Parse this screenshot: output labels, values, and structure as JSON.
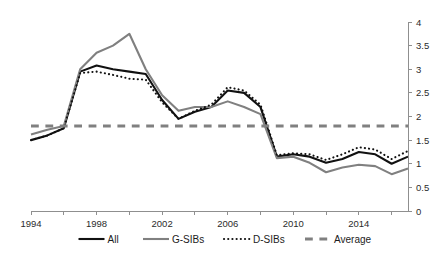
{
  "chart_data": {
    "type": "line",
    "title": "",
    "subtitle": "",
    "xlabel": "",
    "ylabel": "",
    "xlim": [
      1994,
      2017
    ],
    "ylim": [
      0,
      4
    ],
    "y_ticks": [
      "0",
      "0.5",
      "1",
      "1.5",
      "2",
      "2.5",
      "3",
      "3.5",
      "4"
    ],
    "y_tick_values": [
      0,
      0.5,
      1,
      1.5,
      2,
      2.5,
      3,
      3.5,
      4
    ],
    "x_ticks_labeled": [
      "1994",
      "1998",
      "2002",
      "2006",
      "2010",
      "2014"
    ],
    "x_tick_label_values": [
      1994,
      1998,
      2002,
      2006,
      2010,
      2014
    ],
    "x_tick_values": [
      1994,
      1996,
      1998,
      2000,
      2002,
      2004,
      2006,
      2008,
      2010,
      2012,
      2014,
      2016
    ],
    "grid": false,
    "y_axis_position": "right",
    "legend_position": "bottom",
    "x": [
      1994,
      1995,
      1996,
      1997,
      1998,
      1999,
      2000,
      2001,
      2002,
      2003,
      2004,
      2005,
      2006,
      2007,
      2008,
      2009,
      2010,
      2011,
      2012,
      2013,
      2014,
      2015,
      2016,
      2017
    ],
    "series": [
      {
        "name": "All",
        "color": "#111111",
        "style": "solid",
        "width": 2.1,
        "values": [
          1.5,
          1.6,
          1.75,
          2.95,
          3.08,
          3.0,
          2.95,
          2.9,
          2.35,
          1.95,
          2.1,
          2.2,
          2.55,
          2.5,
          2.2,
          1.15,
          1.2,
          1.15,
          1.02,
          1.1,
          1.25,
          1.2,
          1.0,
          1.15
        ]
      },
      {
        "name": "G-SIBs",
        "color": "#808080",
        "style": "solid",
        "width": 2.1,
        "values": [
          1.62,
          1.72,
          1.8,
          3.0,
          3.35,
          3.5,
          3.75,
          3.0,
          2.45,
          2.12,
          2.2,
          2.2,
          2.32,
          2.2,
          2.05,
          1.12,
          1.15,
          1.02,
          0.82,
          0.92,
          0.98,
          0.95,
          0.78,
          0.9
        ]
      },
      {
        "name": "D-SIBs",
        "color": "#111111",
        "style": "dotted",
        "width": 2.1,
        "values": [
          1.5,
          1.6,
          1.75,
          2.92,
          2.95,
          2.88,
          2.8,
          2.78,
          2.3,
          1.95,
          2.12,
          2.25,
          2.62,
          2.55,
          2.25,
          1.18,
          1.22,
          1.2,
          1.08,
          1.2,
          1.35,
          1.3,
          1.1,
          1.27
        ]
      },
      {
        "name": "Average",
        "color": "#808080",
        "style": "dashed",
        "width": 3.0,
        "constant": 1.8,
        "values": [
          1.8,
          1.8,
          1.8,
          1.8,
          1.8,
          1.8,
          1.8,
          1.8,
          1.8,
          1.8,
          1.8,
          1.8,
          1.8,
          1.8,
          1.8,
          1.8,
          1.8,
          1.8,
          1.8,
          1.8,
          1.8,
          1.8,
          1.8,
          1.8
        ]
      }
    ],
    "legend": [
      {
        "label": "All",
        "color": "#111111",
        "style": "solid"
      },
      {
        "label": "G-SIBs",
        "color": "#808080",
        "style": "solid"
      },
      {
        "label": "D-SIBs",
        "color": "#111111",
        "style": "dotted"
      },
      {
        "label": "Average",
        "color": "#808080",
        "style": "dashed"
      }
    ]
  }
}
